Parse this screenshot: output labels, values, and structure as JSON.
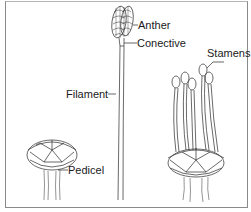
{
  "diagram": {
    "labels": {
      "anther": "Anther",
      "conective": "Conective",
      "filament": "Filament",
      "stamens": "Stamens",
      "pedicel": "Pedicel"
    },
    "colors": {
      "line": "#2a2a2a",
      "border": "#8a8a8a",
      "background": "#ffffff"
    }
  }
}
